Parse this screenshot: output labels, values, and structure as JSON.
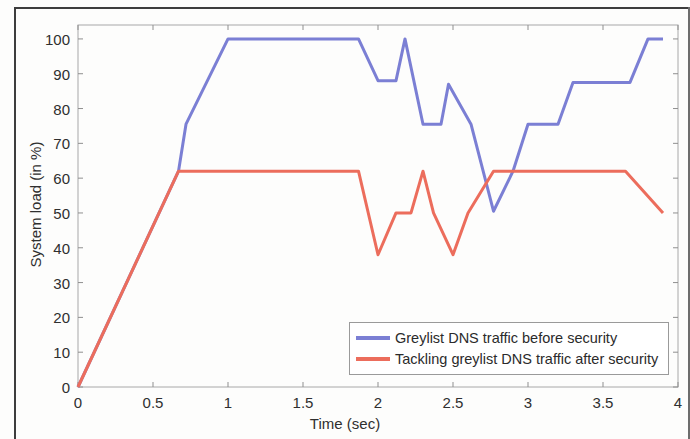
{
  "figure": {
    "xlabel": "Time (sec)",
    "ylabel": "System load (in %)"
  },
  "legend": {
    "entries": [
      {
        "label": "Greylist DNS traffic before security",
        "color": "#7b7fd4",
        "swatch_name": "legend-swatch-before"
      },
      {
        "label": "Tackling greylist DNS traffic after security",
        "color": "#ec6d5c",
        "swatch_name": "legend-swatch-after"
      }
    ]
  },
  "chart_data": {
    "type": "line",
    "title": "",
    "xlabel": "Time (sec)",
    "ylabel": "System load (in %)",
    "xlim": [
      0,
      4
    ],
    "ylim": [
      0,
      104
    ],
    "xticks": [
      0,
      0.5,
      1,
      1.5,
      2,
      2.5,
      3,
      3.5,
      4
    ],
    "xticklabels": [
      "0",
      "0.5",
      "1",
      "1.5",
      "2",
      "2.5",
      "3",
      "3.5",
      "4"
    ],
    "yticks": [
      0,
      10,
      20,
      30,
      40,
      50,
      60,
      70,
      80,
      90,
      100
    ],
    "yticklabels": [
      "0",
      "10",
      "20",
      "30",
      "40",
      "50",
      "60",
      "70",
      "80",
      "90",
      "100"
    ],
    "grid": false,
    "legend_position": "lower right",
    "series": [
      {
        "name": "Greylist DNS traffic before security",
        "color": "#7b7fd4",
        "x": [
          0,
          0.67,
          0.72,
          1.0,
          1.87,
          2.0,
          2.12,
          2.18,
          2.3,
          2.42,
          2.47,
          2.62,
          2.77,
          2.9,
          3.0,
          3.2,
          3.3,
          3.55,
          3.68,
          3.8,
          3.9
        ],
        "y": [
          0,
          62,
          75.5,
          100,
          100,
          88,
          88,
          100,
          75.5,
          75.5,
          87,
          75.5,
          50.5,
          62,
          75.5,
          75.5,
          87.5,
          87.5,
          87.5,
          100,
          100
        ]
      },
      {
        "name": "Tackling greylist DNS traffic after security",
        "color": "#ec6d5c",
        "x": [
          0,
          0.67,
          1.87,
          2.0,
          2.12,
          2.22,
          2.3,
          2.37,
          2.5,
          2.6,
          2.77,
          3.65,
          3.9
        ],
        "y": [
          0,
          62,
          62,
          38,
          50,
          50,
          62,
          50,
          38,
          50,
          62,
          62,
          50
        ]
      }
    ]
  }
}
